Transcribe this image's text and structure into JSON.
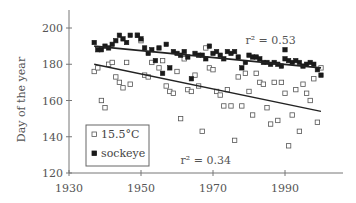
{
  "chart_data": {
    "type": "scatter",
    "title": "",
    "xlabel": "",
    "ylabel": "Day of the year",
    "xlim": [
      1930,
      2002
    ],
    "ylim": [
      120,
      210
    ],
    "x_ticks": [
      1930,
      1950,
      1970,
      1990
    ],
    "y_ticks": [
      120,
      140,
      160,
      180,
      200
    ],
    "grid": false,
    "legend": {
      "position": "lower-left",
      "entries": [
        {
          "label": "15.5°C",
          "marker": "open-square"
        },
        {
          "label": "sockeye",
          "marker": "filled-square"
        }
      ]
    },
    "annotations": [
      {
        "text": "r² = 0.53",
        "x": 1986,
        "y": 191,
        "series": "sockeye"
      },
      {
        "text": "r² = 0.34",
        "x": 1968,
        "y": 125,
        "series": "15.5°C"
      }
    ],
    "series": [
      {
        "name": "15.5°C",
        "marker": "open-square",
        "color": "#555555",
        "points": [
          [
            1937,
            176
          ],
          [
            1938,
            178
          ],
          [
            1939,
            160
          ],
          [
            1940,
            156
          ],
          [
            1941,
            180
          ],
          [
            1942,
            181
          ],
          [
            1943,
            173
          ],
          [
            1944,
            170
          ],
          [
            1945,
            167
          ],
          [
            1946,
            181
          ],
          [
            1947,
            169
          ],
          [
            1949,
            196
          ],
          [
            1950,
            193
          ],
          [
            1951,
            174
          ],
          [
            1952,
            173
          ],
          [
            1953,
            181
          ],
          [
            1955,
            178
          ],
          [
            1956,
            182
          ],
          [
            1957,
            168
          ],
          [
            1958,
            165
          ],
          [
            1959,
            164
          ],
          [
            1960,
            176
          ],
          [
            1961,
            150
          ],
          [
            1962,
            183
          ],
          [
            1963,
            166
          ],
          [
            1964,
            165
          ],
          [
            1965,
            174
          ],
          [
            1966,
            168
          ],
          [
            1967,
            143
          ],
          [
            1968,
            189
          ],
          [
            1969,
            178
          ],
          [
            1970,
            177
          ],
          [
            1971,
            165
          ],
          [
            1972,
            163
          ],
          [
            1973,
            157
          ],
          [
            1974,
            166
          ],
          [
            1975,
            157
          ],
          [
            1976,
            138
          ],
          [
            1977,
            173
          ],
          [
            1978,
            157
          ],
          [
            1979,
            175
          ],
          [
            1980,
            165
          ],
          [
            1981,
            152
          ],
          [
            1982,
            175
          ],
          [
            1983,
            170
          ],
          [
            1984,
            169
          ],
          [
            1985,
            156
          ],
          [
            1986,
            147
          ],
          [
            1987,
            170
          ],
          [
            1988,
            149
          ],
          [
            1989,
            170
          ],
          [
            1990,
            164
          ],
          [
            1991,
            135
          ],
          [
            1992,
            152
          ],
          [
            1993,
            166
          ],
          [
            1994,
            143
          ],
          [
            1995,
            169
          ],
          [
            1996,
            164
          ],
          [
            1997,
            160
          ],
          [
            1998,
            172
          ],
          [
            1999,
            148
          ],
          [
            2000,
            178
          ]
        ],
        "regression": {
          "x": [
            1937,
            2000
          ],
          "y": [
            180,
            154
          ],
          "r2": 0.34
        }
      },
      {
        "name": "sockeye",
        "marker": "filled-square",
        "color": "#1a1a1a",
        "points": [
          [
            1937,
            192
          ],
          [
            1938,
            188
          ],
          [
            1939,
            188
          ],
          [
            1940,
            190
          ],
          [
            1941,
            189
          ],
          [
            1942,
            191
          ],
          [
            1943,
            193
          ],
          [
            1944,
            196
          ],
          [
            1945,
            194
          ],
          [
            1946,
            192
          ],
          [
            1947,
            196
          ],
          [
            1949,
            196
          ],
          [
            1950,
            194
          ],
          [
            1951,
            189
          ],
          [
            1952,
            186
          ],
          [
            1953,
            188
          ],
          [
            1954,
            182
          ],
          [
            1955,
            189
          ],
          [
            1956,
            175
          ],
          [
            1957,
            191
          ],
          [
            1958,
            178
          ],
          [
            1959,
            187
          ],
          [
            1960,
            186
          ],
          [
            1961,
            185
          ],
          [
            1962,
            187
          ],
          [
            1963,
            184
          ],
          [
            1964,
            172
          ],
          [
            1965,
            186
          ],
          [
            1966,
            185
          ],
          [
            1967,
            185
          ],
          [
            1968,
            183
          ],
          [
            1969,
            190
          ],
          [
            1970,
            186
          ],
          [
            1971,
            187
          ],
          [
            1972,
            185
          ],
          [
            1973,
            183
          ],
          [
            1974,
            187
          ],
          [
            1975,
            186
          ],
          [
            1976,
            187
          ],
          [
            1977,
            184
          ],
          [
            1978,
            178
          ],
          [
            1979,
            181
          ],
          [
            1980,
            185
          ],
          [
            1981,
            184
          ],
          [
            1982,
            184
          ],
          [
            1983,
            183
          ],
          [
            1984,
            181
          ],
          [
            1985,
            181
          ],
          [
            1986,
            180
          ],
          [
            1987,
            181
          ],
          [
            1988,
            180
          ],
          [
            1989,
            179
          ],
          [
            1990,
            183
          ],
          [
            1991,
            182
          ],
          [
            1992,
            181
          ],
          [
            1993,
            182
          ],
          [
            1994,
            181
          ],
          [
            1995,
            179
          ],
          [
            1996,
            180
          ],
          [
            1997,
            181
          ],
          [
            1998,
            180
          ],
          [
            1999,
            177
          ],
          [
            2000,
            174
          ],
          [
            1990,
            188
          ]
        ],
        "regression": {
          "x": [
            1937,
            2000
          ],
          "y": [
            190,
            178
          ],
          "r2": 0.53
        }
      }
    ]
  }
}
